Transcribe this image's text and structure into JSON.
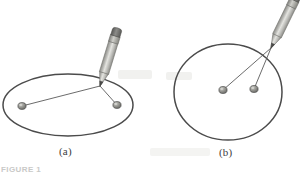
{
  "figure": {
    "type": "textbook-illustration",
    "background_color": "#ffffff",
    "figure_number_text": "FIGURE 1",
    "panels": [
      {
        "id": "a",
        "caption": "(a)",
        "shape": "ellipse",
        "curve_color": "#4b4b4b",
        "description": "Wide flattened ellipse drawn in perspective with two tacks far apart",
        "tacks": [
          {
            "label": "tack-left",
            "x": 22,
            "y": 106
          },
          {
            "label": "tack-right",
            "x": 117,
            "y": 105
          }
        ],
        "pencil_point": {
          "x": 100,
          "y": 86
        },
        "string_color": "#5a5a5a"
      },
      {
        "id": "b",
        "caption": "(b)",
        "shape": "circle",
        "curve_color": "#4b4b4b",
        "description": "Near circular shape with two tacks close together near the center",
        "tacks": [
          {
            "label": "tack-left",
            "x": 223,
            "y": 90
          },
          {
            "label": "tack-right",
            "x": 254,
            "y": 89
          }
        ],
        "pencil_point": {
          "x": 271,
          "y": 48
        },
        "string_color": "#5a5a5a"
      }
    ],
    "pencil": {
      "body_color": "#b9b9b6",
      "body_highlight": "#e2e2de",
      "body_shadow": "#8e8e8a",
      "ferrule_color": "#9a9a96",
      "eraser_color": "#6a6a68",
      "tip_color": "#4a4a48"
    },
    "tack": {
      "head_color": "#8a8a86",
      "head_highlight": "#c5c5c0",
      "outline_color": "#4f4f4d"
    },
    "caption_color": "#40403f"
  }
}
